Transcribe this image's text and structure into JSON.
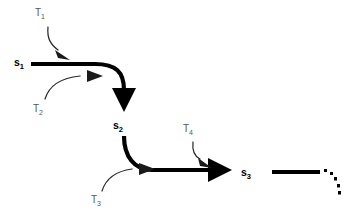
{
  "diagram": {
    "background_color": "#ffffff",
    "state_color": "#000000",
    "transition_color": "#595959",
    "states": [
      {
        "id": "s1",
        "base": "s",
        "sub": "1",
        "label": "s₁",
        "x": 14,
        "y": 66
      },
      {
        "id": "s2",
        "base": "s",
        "sub": "2",
        "label": "s₂",
        "x": 113,
        "y": 129
      },
      {
        "id": "s3",
        "base": "s",
        "sub": "3",
        "label": "s₃",
        "x": 241,
        "y": 176
      }
    ],
    "transitions": [
      {
        "id": "T1",
        "base": "T",
        "sub": "1",
        "label": "T₁",
        "x": 35,
        "y": 16,
        "from_state": "s1",
        "to_state": "s2"
      },
      {
        "id": "T2",
        "base": "T",
        "sub": "2",
        "label": "T₂",
        "x": 33,
        "y": 112,
        "from_state": "s1",
        "to_state": "s2"
      },
      {
        "id": "T3",
        "base": "T",
        "sub": "3",
        "label": "T₃",
        "x": 91,
        "y": 203,
        "from_state": "s2",
        "to_state": "s3"
      },
      {
        "id": "T4",
        "base": "T",
        "sub": "4",
        "label": "T₄",
        "x": 183,
        "y": 132,
        "from_state": "s2",
        "to_state": "s3"
      }
    ],
    "continuation": {
      "label": "ellipsis-dots",
      "dot_count": 5,
      "description": "dotted arc continuing after s3"
    }
  }
}
